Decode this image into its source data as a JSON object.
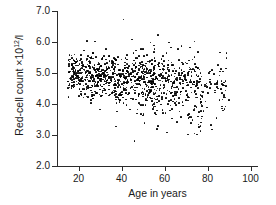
{
  "chart_data": {
    "type": "scatter",
    "title": "",
    "xlabel": "Age in years",
    "ylabel": "Red-cell count ×10¹²/l",
    "ylabel_base": "Red-cell count ×10",
    "ylabel_exp": "12",
    "ylabel_tail": "/l",
    "xlim": [
      10,
      103
    ],
    "ylim": [
      2.0,
      7.0
    ],
    "grid": false,
    "legend": null,
    "xticks": [
      20,
      40,
      60,
      80,
      100
    ],
    "xtick_labels": [
      "20",
      "40",
      "60",
      "80",
      "100"
    ],
    "yticks": [
      2.0,
      3.0,
      4.0,
      5.0,
      6.0,
      7.0
    ],
    "ytick_labels": [
      "2.0",
      "3.0",
      "4.0",
      "5.0",
      "6.0",
      "7.0"
    ],
    "marker": "filled-circle",
    "marker_color": "#000000",
    "n_points": 1050,
    "trend": {
      "slope_per_year": -0.0055,
      "intercept": 5.05,
      "note": "mean count falls from about 4.95 at age 20 to about 4.6 at age 80"
    },
    "spread": {
      "sd_young": 0.33,
      "sd_old": 0.45
    },
    "outliers": [
      {
        "age": 41,
        "count": 6.72
      },
      {
        "age": 57,
        "count": 6.22
      },
      {
        "age": 45,
        "count": 6.08
      },
      {
        "age": 74,
        "count": 6.02
      },
      {
        "age": 62,
        "count": 5.98
      },
      {
        "age": 46,
        "count": 2.8
      },
      {
        "age": 71,
        "count": 3.02
      },
      {
        "age": 75,
        "count": 3.02
      },
      {
        "age": 82,
        "count": 3.18
      },
      {
        "age": 57,
        "count": 3.3
      },
      {
        "age": 90,
        "count": 4.12
      }
    ],
    "axis_color": "#2b2b2b"
  }
}
